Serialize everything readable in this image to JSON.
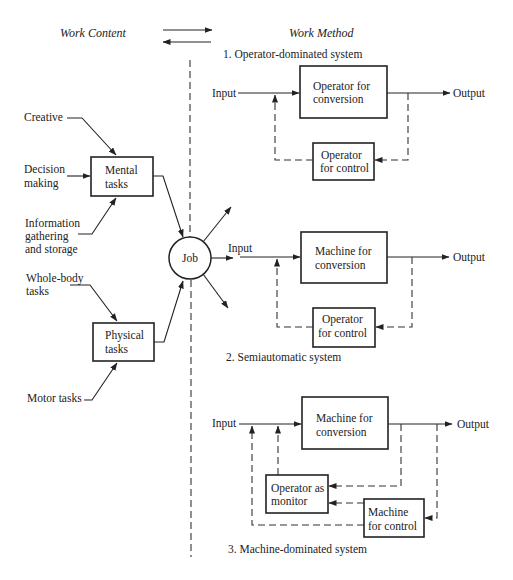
{
  "header": {
    "work_content_label": "Work Content",
    "work_method_label": "Work Method"
  },
  "work_content": {
    "creative": [
      "Creative"
    ],
    "decision_making": [
      "Decision",
      "making"
    ],
    "information": [
      "Information",
      "gathering",
      "and storage"
    ],
    "whole_body": [
      "Whole-body",
      "tasks"
    ],
    "motor": [
      "Motor tasks"
    ],
    "mental_box": [
      "Mental",
      "tasks"
    ],
    "physical_box": [
      "Physical",
      "tasks"
    ],
    "job": "Job"
  },
  "work_method": {
    "systems": [
      {
        "title": "1. Operator-dominated system",
        "input": "Input",
        "output": "Output",
        "conversion": [
          "Operator for",
          "conversion"
        ],
        "control": [
          "Operator",
          "for control"
        ]
      },
      {
        "title": "2. Semiautomatic system",
        "input": "Input",
        "output": "Output",
        "conversion": [
          "Machine for",
          "conversion"
        ],
        "control": [
          "Operator",
          "for control"
        ]
      },
      {
        "title": "3. Machine-dominated system",
        "input": "Input",
        "output": "Output",
        "conversion": [
          "Machine for",
          "conversion"
        ],
        "monitor": [
          "Operator as",
          "monitor"
        ],
        "control": [
          "Machine",
          "for control"
        ]
      }
    ]
  },
  "colors": {
    "line": "#222222",
    "background": "#ffffff"
  }
}
